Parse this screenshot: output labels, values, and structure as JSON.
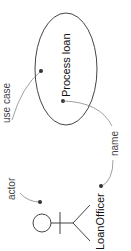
{
  "diagram": {
    "type": "UML use case diagram (rotated 90°)",
    "use_case": {
      "name": "Process loan"
    },
    "actor": {
      "name": "LoanOfficer"
    },
    "annotations": {
      "use_case_label": "use case",
      "actor_label": "actor",
      "name_label": "name"
    },
    "colors": {
      "stroke": "#444444",
      "text": "#111111",
      "annotation": "#555555"
    }
  }
}
